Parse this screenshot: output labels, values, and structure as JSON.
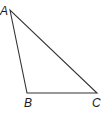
{
  "diagram": {
    "type": "triangle",
    "vertices": [
      {
        "label": "A",
        "x": 10,
        "y": 10,
        "label_x": 0,
        "label_y": 15
      },
      {
        "label": "B",
        "x": 27,
        "y": 93,
        "label_x": 24,
        "label_y": 107
      },
      {
        "label": "C",
        "x": 97,
        "y": 93,
        "label_x": 92,
        "label_y": 107
      }
    ],
    "stroke_color": "#333333",
    "background": "#ffffff"
  }
}
